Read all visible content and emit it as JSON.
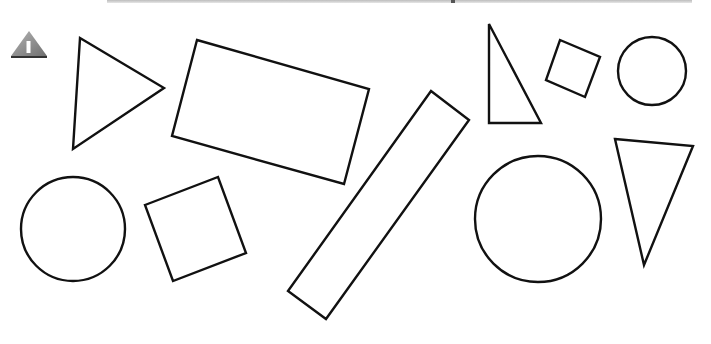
{
  "figure": {
    "badge": {
      "icon": "warning-triangle-icon",
      "label": "I",
      "color": "#8a8a8a"
    },
    "stroke_color": "#111111",
    "fill_color": "#ffffff",
    "shapes": [
      {
        "type": "triangle",
        "name": "right-pointing-triangle",
        "points": "80,38 164,88 73,149"
      },
      {
        "type": "rectangle",
        "name": "large-tilted-rectangle",
        "points": "197,40 369,89 344,184 172,136"
      },
      {
        "type": "rectangle",
        "name": "long-diagonal-bar",
        "points": "431,91 469,120 326,319 288,291"
      },
      {
        "type": "circle",
        "name": "left-circle",
        "cx": 73,
        "cy": 229,
        "r": 52
      },
      {
        "type": "square",
        "name": "tilted-square",
        "points": "145,205 218,177 246,253 173,281"
      },
      {
        "type": "triangle",
        "name": "right-angle-triangle",
        "points": "489,24 489,123 541,123"
      },
      {
        "type": "square",
        "name": "small-tilted-square",
        "points": "560,40 600,57 585,97 546,80"
      },
      {
        "type": "circle",
        "name": "small-circle",
        "cx": 652,
        "cy": 71,
        "r": 34
      },
      {
        "type": "circle",
        "name": "large-circle",
        "cx": 538,
        "cy": 219,
        "r": 63
      },
      {
        "type": "triangle",
        "name": "downward-triangle",
        "points": "615,139 693,146 644,265"
      }
    ]
  }
}
